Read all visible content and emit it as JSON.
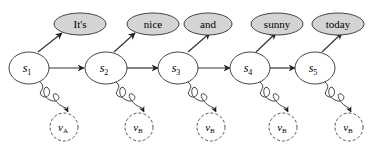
{
  "diagram": {
    "words": [
      "It's",
      "nice",
      "and",
      "sunny",
      "today"
    ],
    "states": [
      {
        "base": "s",
        "sub": "1"
      },
      {
        "base": "s",
        "sub": "2"
      },
      {
        "base": "s",
        "sub": "3"
      },
      {
        "base": "s",
        "sub": "4"
      },
      {
        "base": "s",
        "sub": "5"
      }
    ],
    "observations": [
      {
        "base": "v",
        "sub": "A"
      },
      {
        "base": "v",
        "sub": "B"
      },
      {
        "base": "v",
        "sub": "B"
      },
      {
        "base": "v",
        "sub": "B"
      },
      {
        "base": "v",
        "sub": "B"
      }
    ],
    "colors": {
      "word_fill": "#d4d4d4",
      "stroke": "#333333",
      "background": "#ffffff"
    }
  }
}
